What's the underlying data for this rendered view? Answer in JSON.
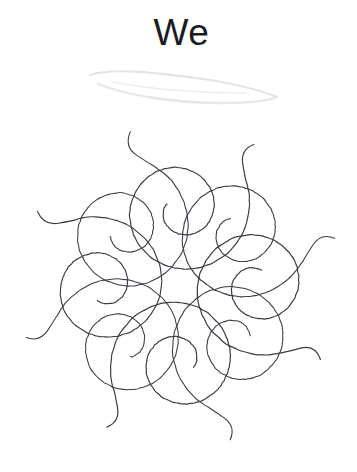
{
  "canvas": {
    "width": 357,
    "height": 472,
    "background_color": "#ffffff"
  },
  "header": {
    "title": "We",
    "title_color": "#1b1b1f",
    "title_font_size_px": 37
  },
  "decoration": {
    "swoosh": {
      "name": "faint-leaf-swoosh",
      "color": "#e6e6e9",
      "description": "very faint light-gray hand-drawn lens/leaf shape beneath the title",
      "bounds": {
        "x": 88,
        "y": 70,
        "width": 190,
        "height": 38
      }
    }
  },
  "artwork": {
    "name": "spiral-rosette",
    "type": "hand-drawn-geometric-doodle",
    "stroke_color": "#3b3b44",
    "stroke_width_px": 1.15,
    "background_color": "#ffffff",
    "petal_count": 8,
    "center": {
      "x": 180,
      "y": 168
    },
    "petal_orbit_radius": 78,
    "spiral": {
      "outer_radius": 72,
      "inner_radius": 15,
      "turns": 1.62,
      "tail_length": 26,
      "description": "each petal is an inward-winding spiral, about 1.6 turns, starting with a straight tail that extends outside the rosette and ending in a small inner curl"
    },
    "center_void": {
      "shape": "polygon",
      "sides": 7,
      "radius": 34,
      "description": "empty polygonal negative space at the middle of the rosette formed by the inner arcs of the surrounding spirals"
    },
    "bounds": {
      "x": 25,
      "y": 128,
      "width": 310,
      "height": 312
    }
  }
}
